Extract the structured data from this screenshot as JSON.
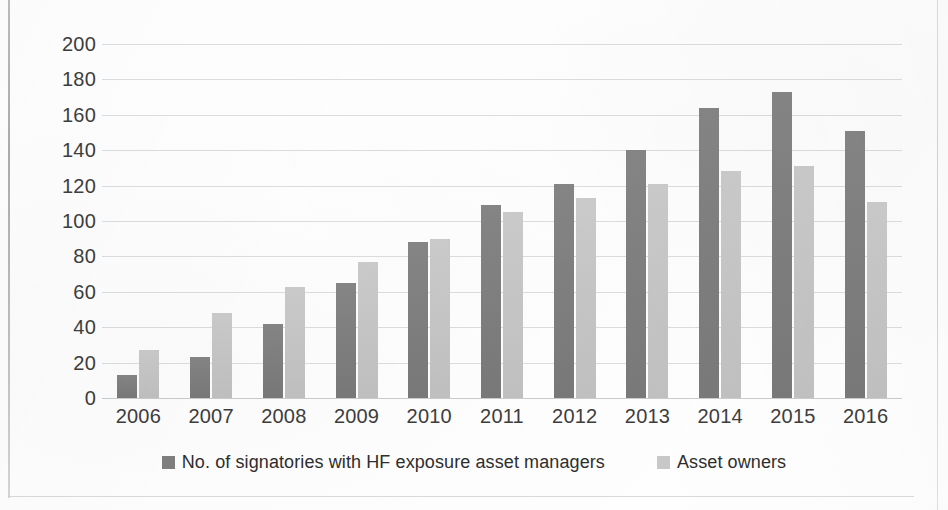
{
  "chart_data": {
    "type": "bar",
    "title": "",
    "subtitle": "",
    "xlabel": "",
    "ylabel": "",
    "categories": [
      "2006",
      "2007",
      "2008",
      "2009",
      "2010",
      "2011",
      "2012",
      "2013",
      "2014",
      "2015",
      "2016"
    ],
    "series": [
      {
        "name": "No. of signatories with HF exposure asset managers",
        "color": "#7f7f7f",
        "values": [
          13,
          23,
          42,
          65,
          88,
          109,
          121,
          140,
          164,
          173,
          151
        ]
      },
      {
        "name": "Asset owners",
        "color": "#c8c8c8",
        "values": [
          27,
          48,
          63,
          77,
          90,
          105,
          113,
          121,
          128,
          131,
          111
        ]
      }
    ],
    "ylim": [
      0,
      200
    ],
    "ytick_step": 20,
    "yticks": [
      "200",
      "180",
      "160",
      "140",
      "120",
      "100",
      "80",
      "60",
      "40",
      "20",
      "0"
    ],
    "grid": true,
    "grid_axis": "y",
    "legend_position": "bottom",
    "gridline_color": "#d9dcdf",
    "axis_text_color": "#3d3d3d",
    "background_color": "#fefefe"
  },
  "legend": {
    "entries": [
      {
        "label": "No. of signatories with HF exposure asset managers",
        "swatch": "series-0-swatch"
      },
      {
        "label": "Asset owners",
        "swatch": "series-1-swatch"
      }
    ]
  }
}
